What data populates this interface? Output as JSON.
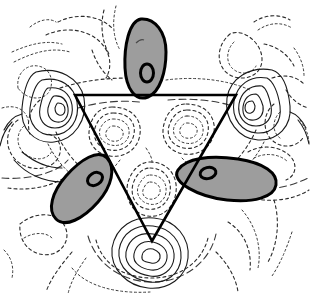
{
  "figure": {
    "title": "",
    "background_color": "#ffffff",
    "width": 311,
    "height": 294
  },
  "chart_data": {
    "type": "contour",
    "title": "",
    "subtitle": "",
    "xlabel": "",
    "ylabel": "",
    "grid": false,
    "legend_position": "none",
    "axis_ticks": [],
    "tick_labels": [],
    "annotations": [
      {
        "name": "top-blob-label",
        "text": "0",
        "x": 147,
        "y": 73
      },
      {
        "name": "left-blob-label",
        "text": "0",
        "x": 95,
        "y": 178
      },
      {
        "name": "right-blob-label",
        "text": "0",
        "x": 208,
        "y": 173
      }
    ],
    "contour_styles": [
      {
        "name": "positive",
        "line": "solid",
        "color": "#1a1a1a"
      },
      {
        "name": "negative",
        "line": "dashed",
        "color": "#3a3a3a"
      },
      {
        "name": "zero",
        "line": "bold-solid",
        "color": "#000000"
      }
    ],
    "filled_regions": [
      {
        "name": "top-lobe",
        "fill": "#9d9d9d",
        "outline": "#000000",
        "center_x": 145,
        "center_y": 58,
        "rx": 21,
        "ry": 40,
        "rotation": -8
      },
      {
        "name": "left-lobe",
        "fill": "#9d9d9d",
        "outline": "#000000",
        "center_x": 83,
        "center_y": 186,
        "rx": 22,
        "ry": 42,
        "rotation": 42
      },
      {
        "name": "right-lobe",
        "fill": "#9d9d9d",
        "outline": "#000000",
        "center_x": 219,
        "center_y": 180,
        "rx": 42,
        "ry": 23,
        "rotation": -12
      }
    ],
    "overlay_polygon": {
      "name": "molecular-frame-triangle",
      "color": "#000000",
      "line_width": 2.6,
      "vertices": [
        [
          75,
          95
        ],
        [
          236,
          95
        ],
        [
          152,
          241
        ]
      ]
    },
    "inner_nodes": [
      {
        "name": "inner-lobe-upper-left",
        "x": 112,
        "y": 131,
        "sign": "negative"
      },
      {
        "name": "inner-lobe-upper-right",
        "x": 185,
        "y": 128,
        "sign": "negative"
      },
      {
        "name": "inner-lobe-lower-center",
        "x": 150,
        "y": 189,
        "sign": "negative"
      }
    ],
    "outer_nodes": [
      {
        "name": "outer-lobe-left-vertex",
        "x": 62,
        "y": 106,
        "sign": "positive"
      },
      {
        "name": "outer-lobe-right-vertex",
        "x": 248,
        "y": 104,
        "sign": "positive"
      },
      {
        "name": "outer-lobe-bottom-vertex",
        "x": 152,
        "y": 256,
        "sign": "positive"
      }
    ]
  }
}
